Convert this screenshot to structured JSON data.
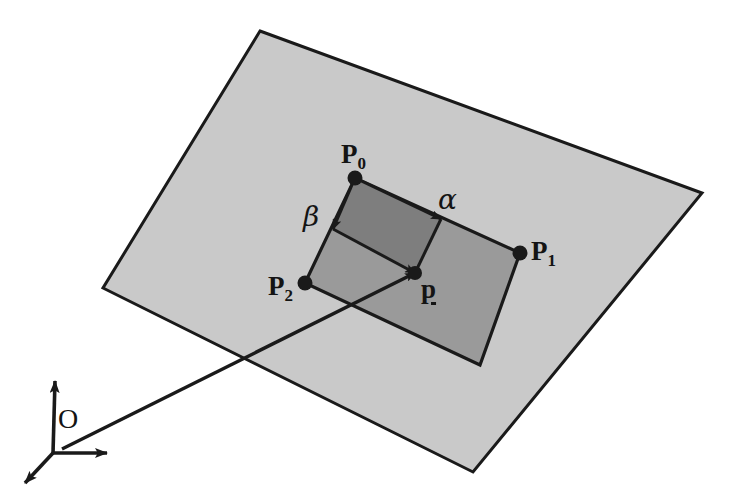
{
  "figure": {
    "canvas": {
      "width": 743,
      "height": 503
    },
    "colors": {
      "background": "#ffffff",
      "plane_fill": "#c9c9c9",
      "patch_fill": "#9a9a9a",
      "inner_fill": "#7e7e7e",
      "stroke": "#1a1a1a",
      "label": "#141414"
    },
    "plane": {
      "name": "infinite-plane",
      "points": "260,31 702,193 473,472 103,288"
    },
    "patch": {
      "name": "quadrilateral-patch",
      "points": "355,178 520,253 480,365 305,283"
    },
    "inner_region": {
      "name": "bilinear-inner-region",
      "points": "355,178 441,219 415,273 333,229"
    },
    "vertices": [
      {
        "id": "P0",
        "label": "P",
        "subscript": "0",
        "x": 355,
        "y": 178,
        "label_x": 341,
        "label_y": 141
      },
      {
        "id": "P1",
        "label": "P",
        "subscript": "1",
        "x": 520,
        "y": 253,
        "label_x": 531,
        "label_y": 238
      },
      {
        "id": "P2",
        "label": "P",
        "subscript": "2",
        "x": 305,
        "y": 283,
        "label_x": 268,
        "label_y": 273
      },
      {
        "id": "P3",
        "label": "",
        "subscript": "",
        "x": 480,
        "y": 365,
        "label_x": 0,
        "label_y": 0
      }
    ],
    "parameters": [
      {
        "id": "alpha",
        "label": "α",
        "x": 441,
        "y": 219,
        "label_x": 438,
        "label_y": 186
      },
      {
        "id": "beta",
        "label": "β",
        "x": 333,
        "y": 229,
        "label_x": 303,
        "label_y": 203
      }
    ],
    "interior_point": {
      "id": "p",
      "label": "p",
      "x": 415,
      "y": 273,
      "label_x": 421,
      "label_y": 276
    },
    "origin": {
      "id": "O",
      "label": "O",
      "x": 53,
      "y": 453,
      "label_x": 58,
      "label_y": 405
    },
    "axes": [
      {
        "name": "axis-up",
        "x1": 53,
        "y1": 453,
        "x2": 55,
        "y2": 381
      },
      {
        "name": "axis-right",
        "x1": 53,
        "y1": 453,
        "x2": 107,
        "y2": 453
      },
      {
        "name": "axis-depth",
        "x1": 53,
        "y1": 453,
        "x2": 25,
        "y2": 483
      }
    ],
    "position_vector": {
      "name": "position-vector-O-to-p",
      "x1": 62,
      "y1": 449,
      "x2": 415,
      "y2": 273
    },
    "interpolation_edges": [
      {
        "name": "edge-beta-to-p",
        "x1": 333,
        "y1": 229,
        "x2": 415,
        "y2": 273
      },
      {
        "name": "edge-alpha-to-p",
        "x1": 441,
        "y1": 219,
        "x2": 415,
        "y2": 273
      }
    ]
  }
}
